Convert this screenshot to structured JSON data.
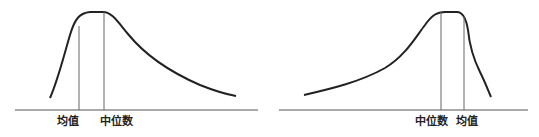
{
  "diagrams": [
    {
      "name": "positive-skew",
      "labels": {
        "mean": "均值",
        "median": "中位数"
      }
    },
    {
      "name": "negative-skew",
      "labels": {
        "median": "中位数",
        "mean": "均值"
      }
    }
  ],
  "colors": {
    "curve": "#222222",
    "axis": "#555555",
    "marker": "#666666"
  }
}
